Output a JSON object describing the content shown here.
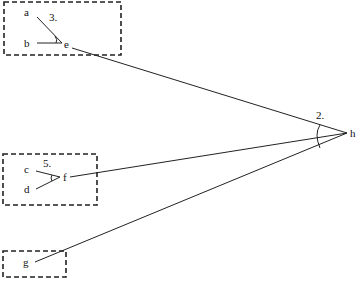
{
  "diagram": {
    "type": "line diagram",
    "points": {
      "a": {
        "label": "a",
        "x": 28,
        "y": 15
      },
      "b": {
        "label": "b",
        "x": 28,
        "y": 46
      },
      "e": {
        "label": "e",
        "x": 66,
        "y": 47
      },
      "c": {
        "label": "c",
        "x": 28,
        "y": 173
      },
      "d": {
        "label": "d",
        "x": 27,
        "y": 193
      },
      "f": {
        "label": "f",
        "x": 64,
        "y": 181
      },
      "g": {
        "label": "g",
        "x": 26,
        "y": 266
      },
      "h": {
        "label": "h",
        "x": 352,
        "y": 137
      }
    },
    "angles": {
      "angle_3": {
        "label": "3.",
        "x": 50,
        "y": 21
      },
      "angle_5": {
        "label": "5.",
        "x": 44,
        "y": 168
      },
      "angle_2": {
        "label": "2.",
        "x": 317,
        "y": 119
      }
    },
    "groups": [
      {
        "name": "box-ab-e",
        "members": [
          "a",
          "b",
          "e"
        ]
      },
      {
        "name": "box-cd-f",
        "members": [
          "c",
          "d",
          "f"
        ]
      },
      {
        "name": "box-g",
        "members": [
          "g"
        ]
      }
    ]
  }
}
